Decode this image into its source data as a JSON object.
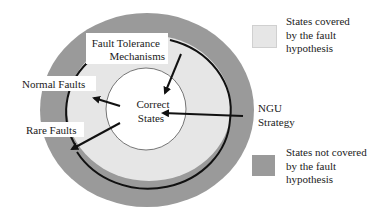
{
  "diagram": {
    "regions": {
      "outer": {
        "label": "States not covered by the fault hypothesis",
        "color": "#9a9a9a"
      },
      "middle": {
        "label": "States covered by the fault hypothesis",
        "color": "#e6e6e6"
      },
      "inner": {
        "label": "Correct States",
        "color": "#ffffff"
      }
    },
    "labels": {
      "correct_states": "Correct\nStates",
      "correct_line1": "Correct",
      "correct_line2": "States",
      "fault_tolerance_line1": "Fault Tolerance",
      "fault_tolerance_line2": "Mechanisms",
      "normal_faults": "Normal Faults",
      "rare_faults": "Rare Faults",
      "ngu_strategy": "NGU\nStrategy"
    },
    "arrows": [
      {
        "from": "Fault Tolerance Mechanisms",
        "to": "Correct States"
      },
      {
        "from": "Correct States",
        "to": "Normal Faults"
      },
      {
        "from": "Correct States",
        "to": "Rare Faults"
      },
      {
        "from": "NGU Strategy",
        "to": "Correct States"
      }
    ]
  },
  "legend": {
    "items": [
      {
        "label": "States covered\nby the fault\nhypothesis",
        "color": "#e6e6e6"
      },
      {
        "label": "States not covered\nby the fault\nhypothesis",
        "color": "#9a9a9a"
      }
    ]
  }
}
